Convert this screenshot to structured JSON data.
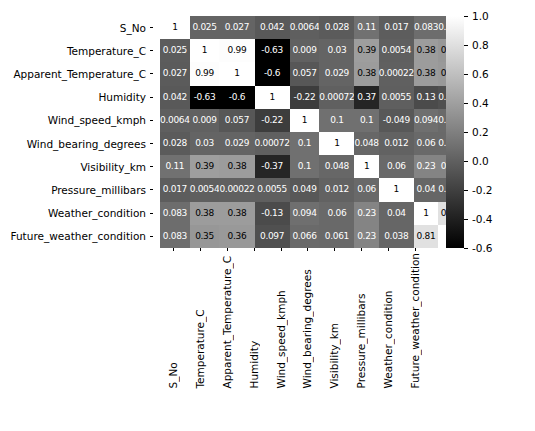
{
  "chart_data": {
    "type": "heatmap",
    "title": "",
    "xlabel": "",
    "ylabel": "",
    "colormap": "grayscale",
    "grid": false,
    "legend_position": "right",
    "colorbar": {
      "vmin": -0.6,
      "vmax": 1.0,
      "ticks": [
        "1.0",
        "0.8",
        "0.6",
        "0.4",
        "0.2",
        "0.0",
        "-0.2",
        "-0.4",
        "-0.6"
      ],
      "tick_values": [
        1.0,
        0.8,
        0.6,
        0.4,
        0.2,
        0.0,
        -0.2,
        -0.4,
        -0.6
      ]
    },
    "categories": [
      "S_No",
      "Temperature_C",
      "Apparent_Temperature_C",
      "Humidity",
      "Wind_speed_kmph",
      "Wind_bearing_degrees",
      "Visibility_km",
      "Pressure_millibars",
      "Weather_condition",
      "Future_weather_condition"
    ],
    "row_labels": [
      "S_No",
      "Temperature_C",
      "Apparent_Temperature_C",
      "Humidity",
      "Wind_speed_kmph",
      "Wind_bearing_degrees",
      "Visibility_km",
      "Pressure_millibars",
      "Weather_condition",
      "Future_weather_condition"
    ],
    "col_labels": [
      "S_No",
      "Temperature_C",
      "Apparent_Temperature_C",
      "Humidity",
      "Wind_speed_kmph",
      "Wind_bearing_degrees",
      "Visibility_km",
      "Pressure_millibars",
      "Weather_condition",
      "Future_weather_condition"
    ],
    "values": [
      [
        1,
        0.025,
        0.027,
        -0.042,
        -0.0064,
        -0.028,
        0.11,
        -0.017,
        0.083,
        0.083
      ],
      [
        -0.025,
        1,
        0.99,
        -0.63,
        0.009,
        0.03,
        0.39,
        -0.0054,
        0.38,
        0.35
      ],
      [
        -0.027,
        0.99,
        1,
        -0.6,
        -0.057,
        0.029,
        0.38,
        0.00022,
        0.38,
        0.36
      ],
      [
        -0.042,
        -0.63,
        -0.6,
        1,
        -0.22,
        0.00072,
        -0.37,
        -0.0055,
        -0.13,
        -0.097
      ],
      [
        -0.0064,
        0.009,
        -0.057,
        -0.22,
        1,
        0.1,
        0.1,
        -0.049,
        0.094,
        0.066
      ],
      [
        -0.028,
        0.03,
        0.029,
        0.00072,
        0.1,
        1,
        0.048,
        0.012,
        0.06,
        0.061
      ],
      [
        0.11,
        0.39,
        0.38,
        -0.37,
        0.1,
        0.048,
        1,
        0.06,
        0.23,
        0.23
      ],
      [
        -0.017,
        -0.0054,
        0.00022,
        -0.0055,
        -0.049,
        0.012,
        0.06,
        1,
        0.04,
        0.038
      ],
      [
        0.083,
        0.38,
        0.38,
        -0.13,
        0.094,
        0.06,
        0.23,
        0.04,
        1,
        0.81
      ],
      [
        0.083,
        0.35,
        0.36,
        -0.097,
        0.066,
        0.061,
        0.23,
        0.038,
        0.81,
        1
      ]
    ],
    "annotations": [
      [
        "1",
        "0.025",
        "0.027",
        "0.042",
        "0.0064",
        "0.028",
        "0.11",
        "0.017",
        "0.083",
        "0.083"
      ],
      [
        "0.025",
        "1",
        "0.99",
        "-0.63",
        "0.009",
        "0.03",
        "0.39",
        "0.0054",
        "0.38",
        "0.35"
      ],
      [
        "0.027",
        "0.99",
        "1",
        "-0.6",
        "0.057",
        "0.029",
        "0.38",
        "0.00022",
        "0.38",
        "0.36"
      ],
      [
        "0.042",
        "-0.63",
        "-0.6",
        "1",
        "-0.22",
        "0.00072",
        "0.37",
        "0.0055",
        "0.13",
        "0.097"
      ],
      [
        "0.0064",
        "0.009",
        "0.057",
        "-0.22",
        "1",
        "0.1",
        "0.1",
        "-0.049",
        "0.094",
        "0.066"
      ],
      [
        "0.028",
        "0.03",
        "0.029",
        "0.00072",
        "0.1",
        "1",
        "0.048",
        "0.012",
        "0.06",
        "0.061"
      ],
      [
        "0.11",
        "0.39",
        "0.38",
        "-0.37",
        "0.1",
        "0.048",
        "1",
        "0.06",
        "0.23",
        "0.23"
      ],
      [
        "0.017",
        "0.0054",
        "0.00022",
        "0.0055",
        "0.049",
        "0.012",
        "0.06",
        "1",
        "0.04",
        "0.038"
      ],
      [
        "0.083",
        "0.38",
        "0.38",
        "-0.13",
        "0.094",
        "0.06",
        "0.23",
        "0.04",
        "1",
        "0.81"
      ],
      [
        "0.083",
        "0.35",
        "0.36",
        "0.097",
        "0.066",
        "0.061",
        "0.23",
        "0.038",
        "0.81",
        "1"
      ]
    ]
  }
}
